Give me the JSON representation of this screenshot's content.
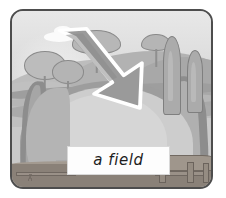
{
  "card": {
    "caption": "a field",
    "border_color": "#4d4d4d",
    "background_color": "#c9c9c9"
  },
  "scene": {
    "title": "a field",
    "style": "greyscale illustrated flashcard of a rural landscape",
    "sky": {
      "name": "sky",
      "color": "#dedede",
      "clouds": 1
    },
    "hills": [
      {
        "name": "far-hill",
        "color": "#bdbdbd"
      },
      {
        "name": "middle-hill",
        "color": "#b2b2b2"
      },
      {
        "name": "right-hill",
        "color": "#a8a8a8"
      },
      {
        "name": "left-low-hill",
        "color": "#c0c0c0"
      }
    ],
    "field": {
      "name": "field",
      "color": "#cdcdcd",
      "outline_color": "#9d9d9d"
    },
    "paths": [
      {
        "name": "left-path",
        "color": "#8d8d8d"
      },
      {
        "name": "right-path",
        "color": "#8d8d8d"
      }
    ],
    "trees": [
      {
        "name": "deciduous-tree-left-large",
        "type": "round"
      },
      {
        "name": "deciduous-tree-left-small",
        "type": "round"
      },
      {
        "name": "umbrella-tree-center",
        "type": "umbrella"
      },
      {
        "name": "round-tree-right",
        "type": "round"
      },
      {
        "name": "cypress-tree-tall",
        "type": "cypress"
      },
      {
        "name": "cypress-tree-short",
        "type": "cypress"
      }
    ],
    "foreground": {
      "name": "ground-strip",
      "color": "#8a8178",
      "fence_color": "#9a9188"
    },
    "arrow": {
      "name": "pointer-arrow",
      "direction": "down-right",
      "fill_color": "#9a9a9a",
      "outline_color": "#ffffff",
      "points_to": "field"
    }
  }
}
